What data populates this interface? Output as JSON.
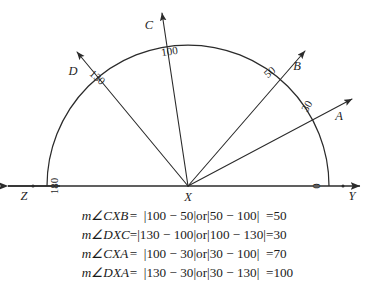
{
  "figure": {
    "vertex_label": "X",
    "left_ray_label": "Z",
    "right_ray_label": "Y",
    "scale_zero": "0",
    "scale_straight": "180",
    "rays": [
      {
        "point": "A",
        "reading": "30",
        "angle_deg": 30
      },
      {
        "point": "B",
        "reading": "50",
        "angle_deg": 50
      },
      {
        "point": "C",
        "reading": "100",
        "angle_deg": 100
      },
      {
        "point": "D",
        "reading": "130",
        "angle_deg": 130
      }
    ],
    "center": {
      "x": 188,
      "y": 186
    },
    "radius": 141,
    "colors": {
      "ink": "#2b2b2b",
      "text": "#1f1f1f"
    }
  },
  "equations": [
    {
      "lhs": "m∠CXB",
      "eq1": "=",
      "expr1": "|100 − 50|",
      "or": "or",
      "expr2": "|50 − 100|",
      "eq2": "=",
      "result": "50"
    },
    {
      "lhs": "m∠DXC",
      "eq1": "=",
      "expr1": "|130 − 100|",
      "or": "or",
      "expr2": "|100 − 130|",
      "eq2": "=",
      "result": "30"
    },
    {
      "lhs": "m∠CXA",
      "eq1": "=",
      "expr1": "|100 − 30|",
      "or": "or",
      "expr2": "|30 − 100|",
      "eq2": "=",
      "result": "70"
    },
    {
      "lhs": "m∠DXA",
      "eq1": "=",
      "expr1": "|130 − 30|",
      "or": "or",
      "expr2": "|30 − 130|",
      "eq2": "=",
      "result": "100"
    }
  ]
}
